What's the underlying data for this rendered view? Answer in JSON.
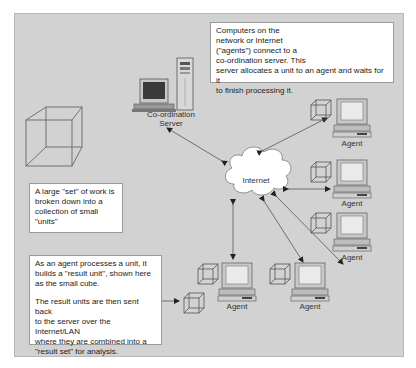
{
  "diagram": {
    "colors": {
      "panel_bg": "#d2d2d2",
      "text_box_bg": "#ffffff",
      "line": "#555555",
      "cloud_fill": "#ffffff"
    },
    "notes": {
      "top": "Computers on the\nnetwork or Internet\n(\"agents\") connect to a\nco-ordination server. This\nserver allocates a unit to an agent and waits for it\nto finish processing it.",
      "left": "A large \"set\" of work is\nbroken down into a\ncollection of small\n\"units\"",
      "bottom_para1": "As an agent processes a unit, it\nbuilds a \"result unit\", shown here\nas the small cube.",
      "bottom_para2": "The result units are then sent back\nto the server over the Internet/LAN\nwhere they are combined into a\n\"result set\" for analysis."
    },
    "nodes": {
      "server_label_line1": "Co-ordination",
      "server_label_line2": "Server",
      "cloud_label": "Internet",
      "agents": [
        {
          "label": "Agent"
        },
        {
          "label": "Agent"
        },
        {
          "label": "Agent"
        },
        {
          "label": "Agent"
        },
        {
          "label": "Agent"
        }
      ]
    }
  }
}
